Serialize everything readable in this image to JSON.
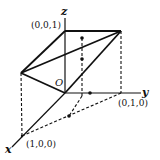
{
  "diagram": {
    "axes": {
      "x_label": "x",
      "y_label": "y",
      "z_label": "z",
      "origin_label": "O"
    },
    "points": {
      "p100": "(1,0,0)",
      "p010": "(0,1,0)",
      "p001": "(0,0,1)"
    },
    "colors": {
      "stroke": "#111111",
      "background": "#ffffff"
    }
  }
}
